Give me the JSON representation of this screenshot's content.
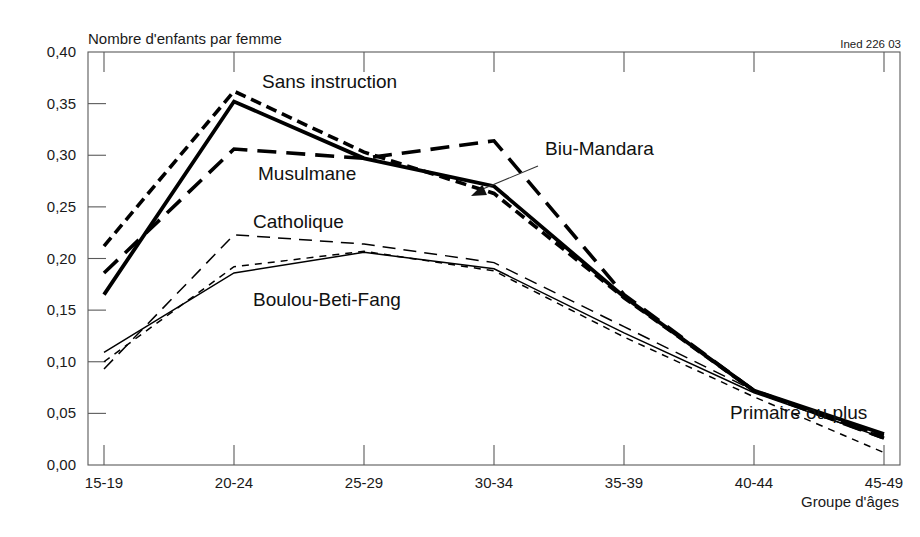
{
  "credit": "Ined 226 03",
  "chart_data": {
    "type": "line",
    "title": "",
    "ylabel": "Nombre d'enfants par femme",
    "xlabel": "Groupe d'âges",
    "categories": [
      "15-19",
      "20-24",
      "25-29",
      "30-34",
      "35-39",
      "40-44",
      "45-49"
    ],
    "ytick_labels": [
      "0,00",
      "0,05",
      "0,10",
      "0,15",
      "0,20",
      "0,25",
      "0,30",
      "0,35",
      "0,40"
    ],
    "ytick_values": [
      0.0,
      0.05,
      0.1,
      0.15,
      0.2,
      0.25,
      0.3,
      0.35,
      0.4
    ],
    "ylim": [
      0.0,
      0.4
    ],
    "grid": false,
    "legend": "inline-annotations",
    "series": [
      {
        "name": "Sans instruction",
        "style": "short-dash-bold",
        "color": "#000000",
        "width": 3.6,
        "dash": "11,6",
        "values": [
          0.212,
          0.362,
          0.303,
          0.263,
          0.162,
          0.072,
          0.028
        ],
        "label": "Sans instruction",
        "label_x": 262,
        "label_y": 88
      },
      {
        "name": "Biu-Mandara",
        "style": "solid-bold",
        "color": "#000000",
        "width": 3.8,
        "dash": "none",
        "values": [
          0.165,
          0.352,
          0.297,
          0.27,
          0.163,
          0.072,
          0.03
        ],
        "label": "Biu-Mandara",
        "label_x": 545,
        "label_y": 155
      },
      {
        "name": "Musulmane",
        "style": "long-dash-bold",
        "color": "#000000",
        "width": 3.6,
        "dash": "19,10",
        "values": [
          0.186,
          0.306,
          0.297,
          0.314,
          0.165,
          0.072,
          0.026
        ],
        "label": "Musulmane",
        "label_x": 258,
        "label_y": 180
      },
      {
        "name": "Catholique",
        "style": "long-dash-thin",
        "color": "#000000",
        "width": 1.5,
        "dash": "13,8",
        "values": [
          0.093,
          0.223,
          0.214,
          0.196,
          0.134,
          0.072,
          0.025
        ],
        "label": "Catholique",
        "label_x": 253,
        "label_y": 228
      },
      {
        "name": "Boulou-Beti-Fang",
        "style": "solid-thin",
        "color": "#000000",
        "width": 1.5,
        "dash": "none",
        "values": [
          0.109,
          0.186,
          0.206,
          0.19,
          0.128,
          0.07,
          0.026
        ],
        "label": "Boulou-Beti-Fang",
        "label_x": 253,
        "label_y": 306
      },
      {
        "name": "Primaire ou plus",
        "style": "short-dash-thin",
        "color": "#000000",
        "width": 1.5,
        "dash": "7,6",
        "values": [
          0.1,
          0.192,
          0.207,
          0.188,
          0.124,
          0.066,
          0.012
        ],
        "label": "Primaire ou plus",
        "label_x": 730,
        "label_y": 419
      }
    ],
    "annotations": [
      {
        "name": "biu-mandara-leader",
        "from_x": 538,
        "from_y": 166,
        "to_x": 471,
        "to_y": 196
      }
    ]
  }
}
